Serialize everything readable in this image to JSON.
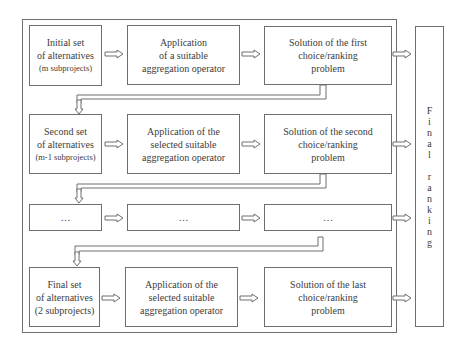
{
  "diagram": {
    "type": "flowchart",
    "rows": [
      {
        "id": "row1",
        "set_box": {
          "lines": [
            "Initial set",
            "of alternatives",
            "(m subprojects)"
          ]
        },
        "operator_box": {
          "lines": [
            "Application",
            "of a suitable",
            "aggregation operator"
          ]
        },
        "solution_box": {
          "lines": [
            "Solution of the first",
            "choice/ranking",
            "problem"
          ]
        }
      },
      {
        "id": "row2",
        "set_box": {
          "lines": [
            "Second set",
            "of alternatives",
            "(m-1 subprojects)"
          ]
        },
        "operator_box": {
          "lines": [
            "Application of  the",
            "selected suitable",
            "aggregation operator"
          ]
        },
        "solution_box": {
          "lines": [
            "Solution of the second",
            "choice/ranking",
            "problem"
          ]
        }
      },
      {
        "id": "row3",
        "set_box": {
          "lines": [
            "…"
          ]
        },
        "operator_box": {
          "lines": [
            "…"
          ]
        },
        "solution_box": {
          "lines": [
            "…"
          ]
        }
      },
      {
        "id": "row4",
        "set_box": {
          "lines": [
            "Final set",
            "of alternatives",
            "(2 subprojects)"
          ]
        },
        "operator_box": {
          "lines": [
            "Application of  the",
            "selected suitable",
            "aggregation operator"
          ]
        },
        "solution_box": {
          "lines": [
            "Solution of the last",
            "choice/ranking",
            "problem"
          ]
        }
      }
    ],
    "final_box": {
      "letters": [
        "F",
        "i",
        "n",
        "a",
        "l",
        "",
        "r",
        "a",
        "n",
        "k",
        "i",
        "n",
        "g"
      ],
      "label": "Final ranking"
    },
    "colors": {
      "stroke": "#6e6e6e",
      "text": "#3c3c3c",
      "background": "#ffffff"
    }
  }
}
